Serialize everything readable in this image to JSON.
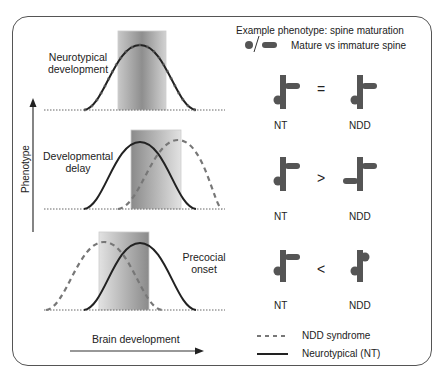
{
  "header": {
    "title": "Example phenotype: spine maturation",
    "spine_legend": "Mature vs immature spine"
  },
  "panels": [
    {
      "label_line1": "Neurotypical",
      "label_line2": "development",
      "comparison": "=",
      "left": "NT",
      "right": "NDD"
    },
    {
      "label_line1": "Developmental",
      "label_line2": "delay",
      "comparison": ">",
      "left": "NT",
      "right": "NDD"
    },
    {
      "label_line1": "Precocial",
      "label_line2": "onset",
      "comparison": "<",
      "left": "NT",
      "right": "NDD"
    }
  ],
  "axes": {
    "y_label": "Phenotype",
    "x_label": "Brain development"
  },
  "legend": {
    "dashed": "NDD syndrome",
    "solid": "Neurotypical (NT)"
  },
  "colors": {
    "curve": "#222222",
    "dashed": "#777777",
    "spine": "#555555",
    "shade_dark": "#8a8a8a",
    "shade_light": "#e6e6e6"
  }
}
